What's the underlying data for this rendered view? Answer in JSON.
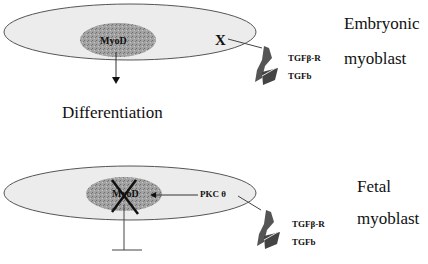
{
  "top_panel": {
    "cell_label_line1": "Embryonic",
    "cell_label_line2": "myoblast",
    "nucleus_label": "MyoD",
    "inhibitor_label": "X",
    "receptor_label": "TGFβ-R",
    "ligand_label": "TGFb",
    "outcome_label": "Differentiation"
  },
  "bottom_panel": {
    "cell_label_line1": "Fetal",
    "cell_label_line2": "myoblast",
    "nucleus_label": "MyoD",
    "kinase_label": "PKC θ",
    "receptor_label": "TGFβ-R",
    "ligand_label": "TGFb"
  },
  "colors": {
    "cell_fill": "#ececec",
    "cell_stroke": "#555555",
    "nucleus_fill": "#9a9a9a",
    "receptor_fill": "#555555",
    "ink": "#111111"
  }
}
